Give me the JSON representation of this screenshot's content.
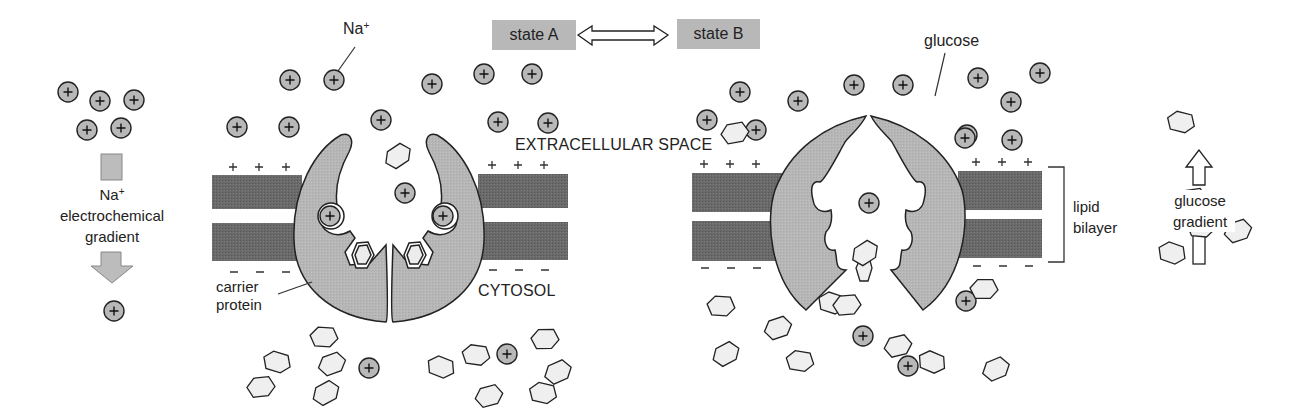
{
  "labels": {
    "na_plus_top": "Na",
    "na_sup": "+",
    "na_gradient_line1": "Na",
    "na_gradient_line2": "electrochemical",
    "na_gradient_line3": "gradient",
    "state_a": "state A",
    "state_b": "state B",
    "glucose": "glucose",
    "extracellular": "EXTRACELLULAR SPACE",
    "cytosol": "CYTOSOL",
    "carrier_line1": "carrier",
    "carrier_line2": "protein",
    "lipid_line1": "lipid",
    "lipid_line2": "bilayer",
    "glucose_gradient_line1": "glucose",
    "glucose_gradient_line2": "gradient"
  },
  "colors": {
    "membrane": "#6a6a6a",
    "protein": "#b4b4b4",
    "ion_fill": "#b8b8b8",
    "glucose_fill": "#efefef",
    "stroke": "#222222",
    "state_box": "#b8b8b8"
  },
  "sodium_ions": [
    [
      68,
      92
    ],
    [
      100,
      101
    ],
    [
      134,
      100
    ],
    [
      87,
      130
    ],
    [
      121,
      128
    ],
    [
      114,
      311
    ],
    [
      237,
      127
    ],
    [
      289,
      127
    ],
    [
      290,
      80
    ],
    [
      334,
      80
    ],
    [
      381,
      120
    ],
    [
      432,
      84
    ],
    [
      484,
      74
    ],
    [
      532,
      74
    ],
    [
      498,
      122
    ],
    [
      548,
      123
    ],
    [
      405,
      193
    ],
    [
      330,
      216
    ],
    [
      443,
      216
    ],
    [
      369,
      368
    ],
    [
      507,
      354
    ],
    [
      707,
      120
    ],
    [
      740,
      92
    ],
    [
      756,
      130
    ],
    [
      798,
      101
    ],
    [
      854,
      85
    ],
    [
      903,
      85
    ],
    [
      978,
      78
    ],
    [
      1040,
      73
    ],
    [
      967,
      135
    ],
    [
      1011,
      102
    ],
    [
      965,
      138
    ],
    [
      1012,
      140
    ],
    [
      869,
      203
    ],
    [
      966,
      301
    ],
    [
      863,
      336
    ],
    [
      908,
      366
    ]
  ],
  "glucose_molecules": [
    [
      398,
      156
    ],
    [
      324,
      337
    ],
    [
      332,
      364
    ],
    [
      277,
      362
    ],
    [
      261,
      387
    ],
    [
      326,
      393
    ],
    [
      476,
      355
    ],
    [
      489,
      396
    ],
    [
      441,
      367
    ],
    [
      545,
      339
    ],
    [
      558,
      372
    ],
    [
      543,
      393
    ],
    [
      735,
      133
    ],
    [
      865,
      253
    ],
    [
      721,
      306
    ],
    [
      778,
      328
    ],
    [
      832,
      303
    ],
    [
      847,
      305
    ],
    [
      726,
      354
    ],
    [
      800,
      361
    ],
    [
      898,
      346
    ],
    [
      932,
      362
    ],
    [
      984,
      289
    ],
    [
      996,
      369
    ],
    [
      1181,
      122
    ],
    [
      1193,
      199
    ],
    [
      1220,
      204
    ],
    [
      1201,
      227
    ],
    [
      1238,
      231
    ],
    [
      1172,
      253
    ]
  ]
}
